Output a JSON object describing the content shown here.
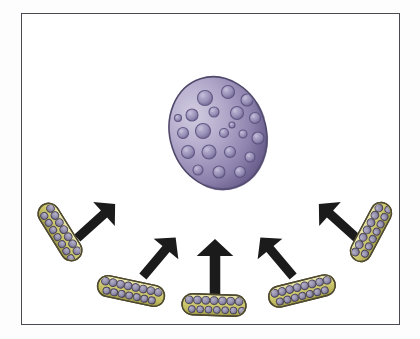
{
  "figure": {
    "background_color": "#ffffff",
    "outer_background_color": "#fdfdfd",
    "frame": {
      "border_color": "#4a4a52",
      "border_width": 1.3,
      "x": 21,
      "y": 13,
      "width": 379,
      "height": 312
    }
  },
  "cell": {
    "label": "large purple cell",
    "shape": "oval",
    "center_x": 218,
    "center_y": 133,
    "radius_x": 48,
    "radius_y": 57,
    "rotation": -18,
    "outline_color": "#50486a",
    "fill_light": "#cdc6de",
    "fill_mid": "#a79ec4",
    "fill_dark": "#6d6290",
    "fill_shadow": "#5b517c",
    "vesicle_fill": "#9a91b8",
    "vesicle_outline": "#5d5480",
    "vesicle_highlight": "#c4bdd8",
    "vesicles": [
      {
        "cx": 205,
        "cy": 98,
        "r": 7.5
      },
      {
        "cx": 228,
        "cy": 92,
        "r": 6.5
      },
      {
        "cx": 247,
        "cy": 100,
        "r": 6.0
      },
      {
        "cx": 192,
        "cy": 115,
        "r": 6.0
      },
      {
        "cx": 214,
        "cy": 112,
        "r": 5.0
      },
      {
        "cx": 237,
        "cy": 113,
        "r": 6.5
      },
      {
        "cx": 255,
        "cy": 118,
        "r": 5.5
      },
      {
        "cx": 183,
        "cy": 133,
        "r": 5.5
      },
      {
        "cx": 203,
        "cy": 131,
        "r": 7.5
      },
      {
        "cx": 224,
        "cy": 133,
        "r": 4.5
      },
      {
        "cx": 243,
        "cy": 134,
        "r": 4.0
      },
      {
        "cx": 258,
        "cy": 138,
        "r": 6.0
      },
      {
        "cx": 188,
        "cy": 152,
        "r": 6.5
      },
      {
        "cx": 209,
        "cy": 152,
        "r": 7.0
      },
      {
        "cx": 230,
        "cy": 152,
        "r": 5.5
      },
      {
        "cx": 250,
        "cy": 157,
        "r": 5.0
      },
      {
        "cx": 198,
        "cy": 170,
        "r": 5.0
      },
      {
        "cx": 219,
        "cy": 172,
        "r": 6.0
      },
      {
        "cx": 240,
        "cy": 172,
        "r": 5.5
      },
      {
        "cx": 178,
        "cy": 118,
        "r": 3.5
      },
      {
        "cx": 232,
        "cy": 125,
        "r": 3.0
      }
    ]
  },
  "arrows": {
    "color": "#1b1b1b",
    "items": [
      {
        "name": "arrow-outer-left",
        "x": 104,
        "y": 214,
        "angle": -42,
        "length": 36,
        "width": 7.5
      },
      {
        "name": "arrow-inner-left",
        "x": 166,
        "y": 249,
        "angle": -50,
        "length": 36,
        "width": 7.5
      },
      {
        "name": "arrow-center",
        "x": 215,
        "y": 256,
        "angle": -90,
        "length": 40,
        "width": 8.5
      },
      {
        "name": "arrow-inner-right",
        "x": 270,
        "y": 249,
        "angle": -130,
        "length": 36,
        "width": 7.5
      },
      {
        "name": "arrow-outer-right",
        "x": 330,
        "y": 214,
        "angle": -138,
        "length": 36,
        "width": 7.5
      }
    ]
  },
  "bacteria": {
    "label": "rod-shaped bacteria",
    "outline_color": "#4f4a30",
    "fill_light": "#e6e2a8",
    "fill_mid": "#cdc86a",
    "fill_dark": "#a8a450",
    "granule_fill": "#8f8aa8",
    "granule_outline": "#4a4558",
    "items": [
      {
        "name": "bacterium-outer-left",
        "cx": 60,
        "cy": 232,
        "length": 64,
        "height": 21,
        "rotation": 58,
        "granules": 14
      },
      {
        "name": "bacterium-lower-left",
        "cx": 131,
        "cy": 291,
        "length": 68,
        "height": 21,
        "rotation": 12,
        "granules": 15
      },
      {
        "name": "bacterium-center",
        "cx": 214,
        "cy": 305,
        "length": 64,
        "height": 21,
        "rotation": 2,
        "granules": 14
      },
      {
        "name": "bacterium-lower-right",
        "cx": 302,
        "cy": 291,
        "length": 68,
        "height": 21,
        "rotation": -14,
        "granules": 15
      },
      {
        "name": "bacterium-outer-right",
        "cx": 371,
        "cy": 232,
        "length": 64,
        "height": 21,
        "rotation": -62,
        "granules": 14
      }
    ]
  }
}
